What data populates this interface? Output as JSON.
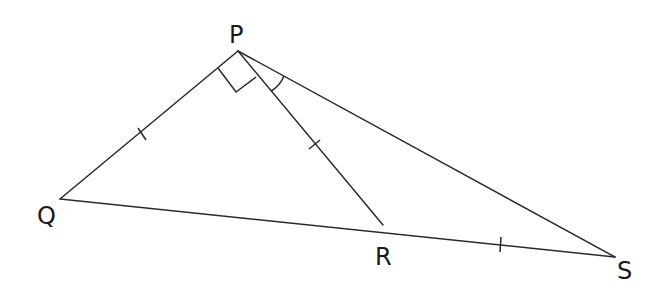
{
  "diagram": {
    "type": "geometry-figure",
    "points": {
      "P": {
        "label": "P",
        "x": 238,
        "y": 51
      },
      "Q": {
        "label": "Q",
        "x": 60,
        "y": 199
      },
      "R": {
        "label": "R",
        "x": 383,
        "y": 225
      },
      "S": {
        "label": "S",
        "x": 615,
        "y": 257
      }
    },
    "segments": [
      {
        "from": "P",
        "to": "Q",
        "tick_marks": 1
      },
      {
        "from": "P",
        "to": "R",
        "tick_marks": 1
      },
      {
        "from": "P",
        "to": "S",
        "tick_marks": 0
      },
      {
        "from": "Q",
        "to": "R",
        "tick_marks": 0
      },
      {
        "from": "R",
        "to": "S",
        "tick_marks": 1
      }
    ],
    "angle_markers": [
      {
        "vertex": "P",
        "between": [
          "Q",
          "R"
        ],
        "kind": "right-angle"
      },
      {
        "vertex": "P",
        "between": [
          "R",
          "S"
        ],
        "kind": "arc"
      }
    ],
    "colors": {
      "line": "#2a2a2a",
      "text": "#1a1a1a",
      "background": "#ffffff"
    }
  }
}
